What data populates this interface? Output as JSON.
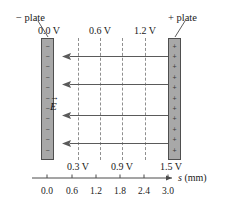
{
  "figure": {
    "width": 225,
    "height": 201,
    "background_color": "#ffffff"
  },
  "plates": {
    "left": {
      "callout_label": "− plate",
      "voltage_label": "0.0 V",
      "charge_symbol": "−",
      "charge_count": 11,
      "fill_color": "#a8a8a8",
      "border_color": "#4f4f4f"
    },
    "right": {
      "callout_label": "+ plate",
      "voltage_label": "1.5 V",
      "charge_symbol": "+",
      "charge_count": 11,
      "fill_color": "#a8a8a8",
      "border_color": "#4f4f4f"
    }
  },
  "field": {
    "label": "E",
    "vector_bar": "→",
    "arrow_count": 4,
    "arrow_direction": "left",
    "arrow_color": "#5a5a5a",
    "arrow_rows_y": [
      52,
      80,
      111,
      139
    ]
  },
  "equipotentials": {
    "line_color": "#8f8f8f",
    "lines": [
      {
        "voltage_label": "0.3 V",
        "x": 78,
        "label_position": "bottom"
      },
      {
        "voltage_label": "0.6 V",
        "x": 100,
        "label_position": "top"
      },
      {
        "voltage_label": "0.9 V",
        "x": 122,
        "label_position": "bottom"
      },
      {
        "voltage_label": "1.2 V",
        "x": 145,
        "label_position": "top"
      }
    ]
  },
  "axis": {
    "name": "s",
    "units": "(mm)",
    "label": "s (mm)",
    "tick_values": [
      "0.0",
      "0.6",
      "1.2",
      "1.8",
      "2.4",
      "3.0"
    ],
    "tick_x_positions": [
      47,
      72,
      96,
      120,
      144,
      168
    ],
    "line_color": "#4a4a4a"
  },
  "chart_data": {
    "type": "line",
    "xlabel": "s (mm)",
    "ylabel": "V (volts)",
    "xlim": [
      0.0,
      3.0
    ],
    "ylim": [
      0.0,
      1.5
    ],
    "grid": false,
    "legend": "none",
    "x": [
      0.0,
      0.6,
      1.2,
      1.8,
      2.4,
      3.0
    ],
    "values": [
      0.0,
      0.3,
      0.6,
      0.9,
      1.2,
      1.5
    ],
    "annotations": [
      "− plate at s = 0.0 mm, V = 0.0 V",
      "+ plate at s = 3.0 mm, V = 1.5 V",
      "E field points from + plate toward − plate"
    ]
  }
}
